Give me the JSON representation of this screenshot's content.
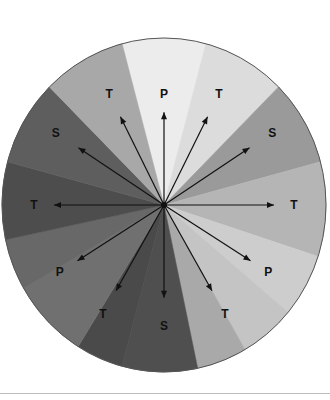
{
  "diagram": {
    "type": "radial-sector-diagram",
    "center": {
      "x": 164,
      "y": 205
    },
    "radius": {
      "rx": 162,
      "ry": 167
    },
    "sectors": [
      {
        "start": -15,
        "end": 15,
        "color": "#ececec"
      },
      {
        "start": 15,
        "end": 45,
        "color": "#dcdcdc"
      },
      {
        "start": 45,
        "end": 75,
        "color": "#9a9a9a"
      },
      {
        "start": 75,
        "end": 108,
        "color": "#b5b5b5"
      },
      {
        "start": 108,
        "end": 130,
        "color": "#cdcdcd"
      },
      {
        "start": 130,
        "end": 150,
        "color": "#c4c4c4"
      },
      {
        "start": 150,
        "end": 168,
        "color": "#a9a9a9"
      },
      {
        "start": 168,
        "end": 195,
        "color": "#4f4f4f"
      },
      {
        "start": 195,
        "end": 212,
        "color": "#4a4a4a"
      },
      {
        "start": 212,
        "end": 240,
        "color": "#707070"
      },
      {
        "start": 240,
        "end": 258,
        "color": "#686868"
      },
      {
        "start": 258,
        "end": 285,
        "color": "#4d4d4d"
      },
      {
        "start": 285,
        "end": 315,
        "color": "#5e5e5e"
      },
      {
        "start": 315,
        "end": 345,
        "color": "#a8a8a8"
      }
    ],
    "arrows": [
      {
        "angle": 0,
        "length": 90,
        "label": "P",
        "label_dist": 108
      },
      {
        "angle": 27,
        "length": 96,
        "label": "T",
        "label_dist": 121
      },
      {
        "angle": 57,
        "length": 102,
        "label": "S",
        "label_dist": 129
      },
      {
        "angle": 90,
        "length": 110,
        "label": "T",
        "label_dist": 130
      },
      {
        "angle": 122,
        "length": 102,
        "label": "P",
        "label_dist": 123
      },
      {
        "angle": 150,
        "length": 96,
        "label": "T",
        "label_dist": 122
      },
      {
        "angle": 180,
        "length": 90,
        "label": "S",
        "label_dist": 117
      },
      {
        "angle": 210,
        "length": 96,
        "label": "T",
        "label_dist": 122
      },
      {
        "angle": 238,
        "length": 102,
        "label": "P",
        "label_dist": 123
      },
      {
        "angle": 270,
        "length": 110,
        "label": "T",
        "label_dist": 130
      },
      {
        "angle": 303,
        "length": 102,
        "label": "S",
        "label_dist": 129
      },
      {
        "angle": 333,
        "length": 96,
        "label": "T",
        "label_dist": 121
      }
    ],
    "line_color": "#111111",
    "outline_color": "#555555"
  }
}
